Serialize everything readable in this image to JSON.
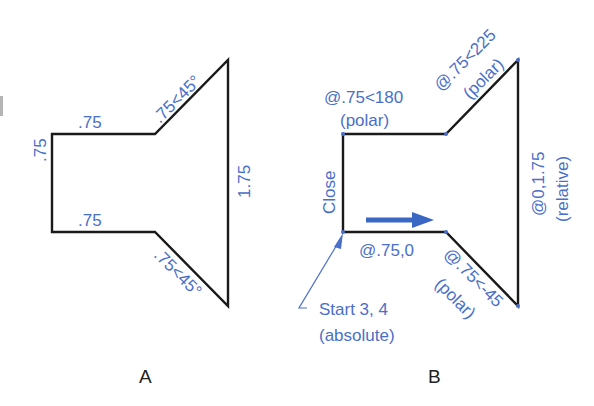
{
  "figure_a": {
    "caption": "A",
    "labels": {
      "top_horizontal": ".75",
      "bottom_horizontal": ".75",
      "left_vertical": ".75",
      "right_vertical": "1.75",
      "upper_diagonal": ".75<45°",
      "lower_diagonal": ".75<45°"
    }
  },
  "figure_b": {
    "caption": "B",
    "labels": {
      "top_horizontal_line1": "@.75<180",
      "top_horizontal_line2": "(polar)",
      "upper_diagonal_line1": "@.75<225",
      "upper_diagonal_line2": "(polar)",
      "right_vertical_line1": "@0,1.75",
      "right_vertical_line2": "(relative)",
      "lower_diagonal_line1": "@.75<-45",
      "lower_diagonal_line2": "(polar)",
      "bottom_horizontal": "@.75,0",
      "left_vertical": "Close",
      "start_line1": "Start 3, 4",
      "start_line2": "(absolute)"
    },
    "direction_arrow_color": "#3a66c4"
  },
  "colors": {
    "annotation": "#4a6fc9",
    "outline": "#1a1a1a",
    "caption": "#222222"
  }
}
